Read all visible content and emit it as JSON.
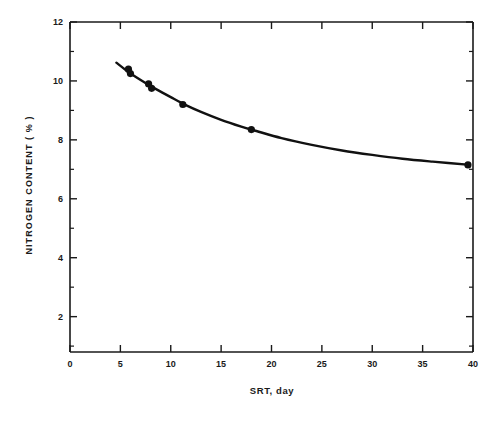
{
  "chart_data": {
    "type": "line",
    "title": "",
    "xlabel": "SRT, day",
    "ylabel": "NITROGEN CONTENT ( % )",
    "xlim": [
      0,
      40
    ],
    "ylim": [
      0.8,
      12
    ],
    "grid": false,
    "legend": null,
    "x_major_ticks": [
      0,
      5,
      10,
      15,
      20,
      25,
      30,
      35,
      40
    ],
    "x_tick_labels": [
      "0",
      "5",
      "10",
      "15",
      "20",
      "25",
      "30",
      "35",
      "40"
    ],
    "y_major_ticks": [
      2,
      4,
      6,
      8,
      10,
      12
    ],
    "y_tick_labels": [
      "2",
      "4",
      "6",
      "8",
      "10",
      "12"
    ],
    "y_minor_ticks": [
      1,
      3,
      5,
      7,
      9,
      11
    ],
    "x_minor_ticks": [],
    "series": [
      {
        "name": "Nitrogen content vs SRT",
        "marker": "filled-circle",
        "color": "#111111",
        "points": [
          {
            "x": 5.8,
            "y": 10.4
          },
          {
            "x": 6.0,
            "y": 10.25
          },
          {
            "x": 7.8,
            "y": 9.9
          },
          {
            "x": 8.1,
            "y": 9.75
          },
          {
            "x": 11.2,
            "y": 9.2
          },
          {
            "x": 18.0,
            "y": 8.35
          },
          {
            "x": 39.5,
            "y": 7.15
          }
        ],
        "fit_curve": [
          {
            "x": 4.6,
            "y": 10.62
          },
          {
            "x": 5.5,
            "y": 10.38
          },
          {
            "x": 6.5,
            "y": 10.14
          },
          {
            "x": 7.5,
            "y": 9.93
          },
          {
            "x": 8.5,
            "y": 9.73
          },
          {
            "x": 10.0,
            "y": 9.45
          },
          {
            "x": 11.5,
            "y": 9.18
          },
          {
            "x": 13.0,
            "y": 8.95
          },
          {
            "x": 15.0,
            "y": 8.68
          },
          {
            "x": 17.0,
            "y": 8.45
          },
          {
            "x": 18.5,
            "y": 8.3
          },
          {
            "x": 21.0,
            "y": 8.06
          },
          {
            "x": 24.0,
            "y": 7.83
          },
          {
            "x": 27.0,
            "y": 7.64
          },
          {
            "x": 30.0,
            "y": 7.49
          },
          {
            "x": 33.0,
            "y": 7.36
          },
          {
            "x": 36.0,
            "y": 7.26
          },
          {
            "x": 39.7,
            "y": 7.15
          }
        ]
      }
    ]
  },
  "axis_style": {
    "line_color": "#1a1a1a",
    "curve_color": "#111111",
    "marker_color": "#111111",
    "background": "#ffffff"
  }
}
